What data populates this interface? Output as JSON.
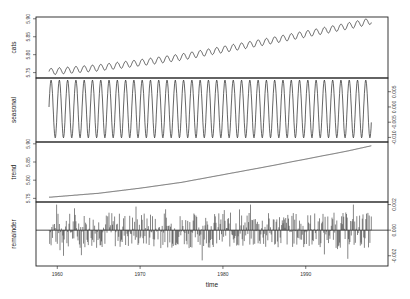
{
  "chart_data": {
    "type": "line",
    "title": "",
    "xlabel": "time",
    "x_range": [
      1959,
      1998
    ],
    "x_ticks": [
      1960,
      1970,
      1980,
      1990
    ],
    "panels": [
      {
        "name": "data",
        "ylabel": "cats",
        "axis_side": "left",
        "ylim": [
          5.735,
          5.905
        ],
        "y_ticks": [
          5.75,
          5.8,
          5.85,
          5.9
        ],
        "y_tick_labels": [
          "5.75",
          "5.80",
          "5.85",
          "5.90"
        ],
        "description": "log CO2 concentration, rising trend with annual oscillation",
        "start_value": 5.752,
        "end_value": 5.895,
        "seasonal_amplitude": 0.009
      },
      {
        "name": "seasonal",
        "ylabel": "seasonal",
        "axis_side": "right",
        "ylim": [
          -0.0115,
          0.0095
        ],
        "y_ticks": [
          -0.01,
          -0.005,
          0.0,
          0.005
        ],
        "y_tick_labels": [
          "-0.010",
          "-0.005",
          "0.000",
          "0.005"
        ],
        "description": "annual sinusoid, amplitude ~0.009, 39 cycles",
        "amplitude_max": 0.0088,
        "amplitude_min": -0.0105
      },
      {
        "name": "trend",
        "ylabel": "trend",
        "axis_side": "left",
        "ylim": [
          5.74,
          5.905
        ],
        "y_ticks": [
          5.75,
          5.8,
          5.85,
          5.9
        ],
        "y_tick_labels": [
          "5.75",
          "5.80",
          "5.85",
          "5.90"
        ],
        "x": [
          1959,
          1965,
          1970,
          1975,
          1980,
          1985,
          1990,
          1995,
          1998
        ],
        "values": [
          5.753,
          5.764,
          5.778,
          5.794,
          5.815,
          5.836,
          5.858,
          5.88,
          5.895
        ]
      },
      {
        "name": "remainder",
        "ylabel": "remainder",
        "axis_side": "right",
        "ylim": [
          -0.0028,
          0.0022
        ],
        "y_ticks": [
          -0.002,
          0.0,
          0.002
        ],
        "y_tick_labels": [
          "-0.002",
          "0.000",
          "0.002"
        ],
        "description": "irregular residual spikes around zero, range approx -0.0025 to 0.002",
        "baseline": 0
      }
    ]
  }
}
